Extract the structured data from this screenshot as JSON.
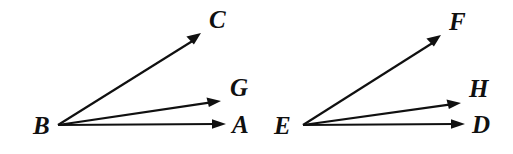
{
  "figure": {
    "type": "geometry-diagram",
    "background_color": "#ffffff",
    "stroke_color": "#101010",
    "diagrams": [
      {
        "name": "left-angle-figure",
        "vertex": {
          "label": "B",
          "x": 58,
          "y": 125,
          "label_x": 33,
          "label_y": 134
        },
        "rays": [
          {
            "name": "ray-BA",
            "label": "A",
            "tip_x": 226,
            "tip_y": 124,
            "label_x": 232,
            "label_y": 133
          },
          {
            "name": "ray-BG",
            "label": "G",
            "tip_x": 221,
            "tip_y": 101,
            "label_x": 230,
            "label_y": 96
          },
          {
            "name": "ray-BC",
            "label": "C",
            "tip_x": 201,
            "tip_y": 33,
            "label_x": 209,
            "label_y": 28
          }
        ]
      },
      {
        "name": "right-angle-figure",
        "vertex": {
          "label": "E",
          "x": 303,
          "y": 125,
          "label_x": 274,
          "label_y": 134
        },
        "rays": [
          {
            "name": "ray-ED",
            "label": "D",
            "tip_x": 465,
            "tip_y": 124,
            "label_x": 472,
            "label_y": 133
          },
          {
            "name": "ray-EH",
            "label": "H",
            "tip_x": 461,
            "tip_y": 103,
            "label_x": 469,
            "label_y": 97
          },
          {
            "name": "ray-EF",
            "label": "F",
            "tip_x": 441,
            "tip_y": 35,
            "label_x": 449,
            "label_y": 30
          }
        ]
      }
    ]
  }
}
